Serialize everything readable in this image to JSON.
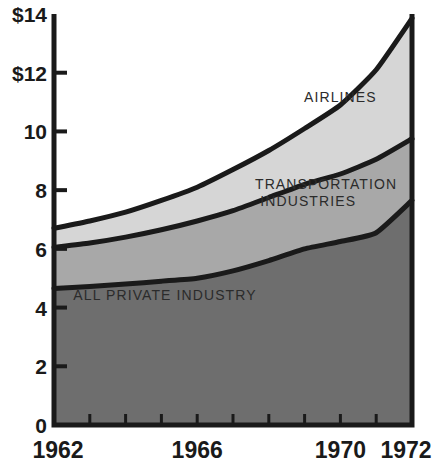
{
  "chart_data": {
    "type": "area",
    "stacked": true,
    "title": "",
    "subtitle": "",
    "xlabel": "",
    "ylabel": "",
    "xlim": [
      1962,
      1972
    ],
    "ylim": [
      0,
      14
    ],
    "grid": false,
    "legend_position": "inline-annotations",
    "x": [
      1962,
      1963,
      1964,
      1965,
      1966,
      1967,
      1968,
      1969,
      1970,
      1971,
      1972
    ],
    "y_ticks": [
      0,
      2,
      4,
      6,
      8,
      10,
      12,
      14
    ],
    "y_tick_labels": [
      "0",
      "2",
      "4",
      "6",
      "8",
      "10",
      "$12",
      "$14"
    ],
    "x_ticks": [
      1962,
      1963,
      1964,
      1965,
      1966,
      1967,
      1968,
      1969,
      1970,
      1971,
      1972
    ],
    "x_tick_labels_shown": [
      "1962",
      "1966",
      "1970",
      "1972"
    ],
    "x_tick_label_years": [
      1962,
      1966,
      1970,
      1972
    ],
    "series": [
      {
        "name": "ALL PRIVATE INDUSTRY",
        "color": "#6e6e6e",
        "cumulative_top": [
          4.65,
          4.72,
          4.8,
          4.9,
          5.0,
          5.25,
          5.6,
          6.0,
          6.25,
          6.55,
          7.65
        ]
      },
      {
        "name": "TRANSPORTATION INDUSTRIES",
        "color": "#a8a8a8",
        "cumulative_top": [
          6.05,
          6.2,
          6.4,
          6.65,
          6.95,
          7.3,
          7.75,
          8.2,
          8.55,
          9.05,
          9.75
        ]
      },
      {
        "name": "AIRLINES",
        "color": "#d6d6d6",
        "cumulative_top": [
          6.7,
          6.95,
          7.25,
          7.65,
          8.1,
          8.7,
          9.35,
          10.1,
          10.9,
          12.1,
          13.85
        ]
      }
    ],
    "annotations": [
      {
        "text": "AIRLINES",
        "x": 1970.0,
        "y": 11.0
      },
      {
        "text": "TRANSPORTATION",
        "x": 1969.6,
        "y": 8.05
      },
      {
        "text": "INDUSTRIES",
        "x": 1969.1,
        "y": 7.45
      },
      {
        "text": "ALL PRIVATE INDUSTRY",
        "x": 1965.1,
        "y": 4.25
      }
    ],
    "colors": {
      "all_private_industry": "#6e6e6e",
      "transportation_industries": "#a8a8a8",
      "airlines": "#d6d6d6",
      "axis": "#1a1a1a",
      "boundary_line": "#1a1a1a",
      "background": "#ffffff"
    }
  }
}
